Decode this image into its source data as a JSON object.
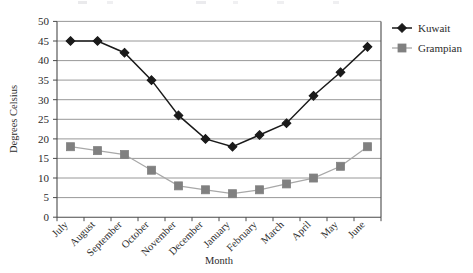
{
  "chart_data": {
    "type": "line",
    "title": "",
    "xlabel": "Month",
    "ylabel": "Degrees Celsius",
    "categories": [
      "July",
      "August",
      "September",
      "October",
      "November",
      "December",
      "January",
      "February",
      "March",
      "April",
      "May",
      "June"
    ],
    "series": [
      {
        "name": "Kuwait",
        "marker": "diamond",
        "color": "#1a1a1a",
        "line_color": "#1a1a1a",
        "values": [
          45,
          45,
          42,
          35,
          26,
          20,
          18,
          21,
          24,
          31,
          37,
          43.5
        ]
      },
      {
        "name": "Grampian",
        "marker": "square",
        "color": "#808080",
        "line_color": "#a8a8a8",
        "values": [
          18,
          17,
          16,
          12,
          8,
          7,
          6,
          7,
          8.5,
          10,
          13,
          18
        ]
      }
    ],
    "ylim": [
      0,
      50
    ],
    "ytick_step": 5,
    "yticks": [
      "0",
      "5",
      "10",
      "15",
      "20",
      "25",
      "30",
      "35",
      "40",
      "45",
      "50"
    ],
    "grid": "horizontal",
    "legend_position": "right"
  },
  "legend": {
    "items": [
      {
        "label": "Kuwait"
      },
      {
        "label": "Grampian"
      }
    ]
  },
  "colors": {
    "kuwait": "#1a1a1a",
    "grampian": "#808080",
    "grampian_line": "#a8a8a8",
    "gridline": "#8c8c8c",
    "axis": "#4a4a4a",
    "background": "#ffffff"
  }
}
